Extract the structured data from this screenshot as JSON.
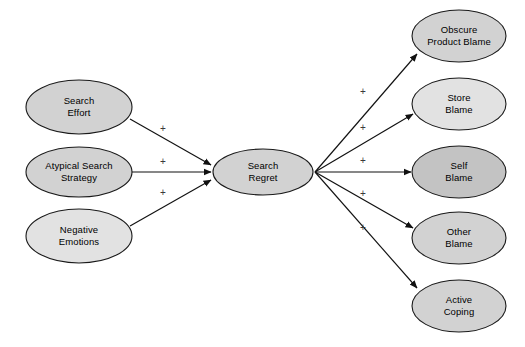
{
  "diagram": {
    "background_color": "#ffffff",
    "node_stroke_color": "#1a1a1a",
    "edge_color": "#111111",
    "sign_color": "#3a3a3a",
    "fill_light": "#e2e2e2",
    "fill_mid": "#d2d2d2",
    "fill_dark": "#c3c3c3",
    "antecedents": [
      {
        "id": "search-effort",
        "label_line1": "Search",
        "label_line2": "Effort",
        "cx": 79,
        "cy": 107,
        "rx": 53,
        "ry": 27,
        "fill": "#d2d2d2"
      },
      {
        "id": "atypical-search-strategy",
        "label_line1": "Atypical Search",
        "label_line2": "Strategy",
        "cx": 79,
        "cy": 172,
        "rx": 53,
        "ry": 25,
        "fill": "#d2d2d2"
      },
      {
        "id": "negative-emotions",
        "label_line1": "Negative",
        "label_line2": "Emotions",
        "cx": 79,
        "cy": 236,
        "rx": 53,
        "ry": 27,
        "fill": "#e2e2e2"
      }
    ],
    "mediator": {
      "id": "search-regret",
      "label_line1": "Search",
      "label_line2": "Regret",
      "cx": 263,
      "cy": 172,
      "rx": 50,
      "ry": 23,
      "fill": "#d2d2d2"
    },
    "outcomes": [
      {
        "id": "obscure-product-blame",
        "label_line1": "Obscure",
        "label_line2": "Product Blame",
        "cx": 459,
        "cy": 36,
        "rx": 47,
        "ry": 26,
        "fill": "#d2d2d2"
      },
      {
        "id": "store-blame",
        "label_line1": "Store",
        "label_line2": "Blame",
        "cx": 459,
        "cy": 104,
        "rx": 47,
        "ry": 26,
        "fill": "#e2e2e2"
      },
      {
        "id": "self-blame",
        "label_line1": "Self",
        "label_line2": "Blame",
        "cx": 459,
        "cy": 172,
        "rx": 47,
        "ry": 26,
        "fill": "#c3c3c3"
      },
      {
        "id": "other-blame",
        "label_line1": "Other",
        "label_line2": "Blame",
        "cx": 459,
        "cy": 238,
        "rx": 47,
        "ry": 26,
        "fill": "#d2d2d2"
      },
      {
        "id": "active-coping",
        "label_line1": "Active",
        "label_line2": "Coping",
        "cx": 459,
        "cy": 306,
        "rx": 47,
        "ry": 26,
        "fill": "#d2d2d2"
      }
    ],
    "edges": [
      {
        "id": "edge-search-effort-to-regret",
        "from": "search-effort",
        "to": "search-regret",
        "sign": "+",
        "x1": 130,
        "y1": 119,
        "x2": 211,
        "y2": 165,
        "sign_x": 163,
        "sign_y": 129
      },
      {
        "id": "edge-atypical-to-regret",
        "from": "atypical-search-strategy",
        "to": "search-regret",
        "sign": "+",
        "x1": 132,
        "y1": 172,
        "x2": 211,
        "y2": 172,
        "sign_x": 163,
        "sign_y": 162
      },
      {
        "id": "edge-negative-emotions-to-regret",
        "from": "negative-emotions",
        "to": "search-regret",
        "sign": "+",
        "x1": 130,
        "y1": 226,
        "x2": 211,
        "y2": 180,
        "sign_x": 163,
        "sign_y": 193
      },
      {
        "id": "edge-regret-to-obscure-product-blame",
        "from": "search-regret",
        "to": "obscure-product-blame",
        "sign": "+",
        "x1": 315,
        "y1": 172,
        "x2": 417,
        "y2": 54,
        "sign_x": 363,
        "sign_y": 92
      },
      {
        "id": "edge-regret-to-store-blame",
        "from": "search-regret",
        "to": "store-blame",
        "sign": "+",
        "x1": 315,
        "y1": 172,
        "x2": 413,
        "y2": 114,
        "sign_x": 363,
        "sign_y": 128
      },
      {
        "id": "edge-regret-to-self-blame",
        "from": "search-regret",
        "to": "self-blame",
        "sign": "+",
        "x1": 315,
        "y1": 172,
        "x2": 411,
        "y2": 172,
        "sign_x": 363,
        "sign_y": 161
      },
      {
        "id": "edge-regret-to-other-blame",
        "from": "search-regret",
        "to": "other-blame",
        "sign": "+",
        "x1": 315,
        "y1": 172,
        "x2": 413,
        "y2": 228,
        "sign_x": 363,
        "sign_y": 194
      },
      {
        "id": "edge-regret-to-active-coping",
        "from": "search-regret",
        "to": "active-coping",
        "sign": "+",
        "x1": 315,
        "y1": 172,
        "x2": 417,
        "y2": 288,
        "sign_x": 363,
        "sign_y": 228
      }
    ]
  }
}
